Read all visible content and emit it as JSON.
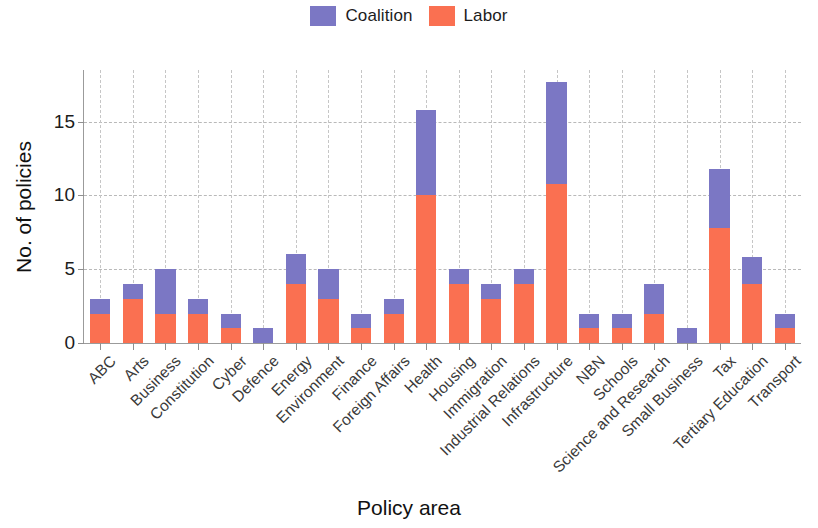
{
  "chart_data": {
    "type": "bar",
    "stacked": true,
    "title": "",
    "xlabel": "Policy area",
    "ylabel": "No. of policies",
    "ylim": [
      0,
      18.5
    ],
    "yticks": [
      0,
      5,
      10,
      15
    ],
    "ytick_labels": [
      "0",
      "5",
      "10",
      "15"
    ],
    "grid": "horizontal-and-vertical-dashed",
    "legend_position": "top-center",
    "categories": [
      "ABC",
      "Arts",
      "Business",
      "Constitution",
      "Cyber",
      "Defence",
      "Energy",
      "Environment",
      "Finance",
      "Foreign Affairs",
      "Health",
      "Housing",
      "Immigration",
      "Industrial Relations",
      "Infrastructure",
      "NBN",
      "Schools",
      "Science and Research",
      "Small Business",
      "Tax",
      "Tertiary Education",
      "Transport"
    ],
    "series": [
      {
        "name": "Labor",
        "color": "#FA7051",
        "values": [
          2,
          3,
          2,
          2,
          1,
          0,
          4,
          3,
          1,
          2,
          10,
          4,
          3,
          4,
          10.8,
          1,
          1,
          2,
          0,
          7.8,
          4,
          1
        ]
      },
      {
        "name": "Coalition",
        "color": "#7B77C4",
        "values": [
          1,
          1,
          3,
          1,
          1,
          1,
          2,
          2,
          1,
          1,
          5.8,
          1,
          1,
          1,
          6.9,
          1,
          1,
          2,
          1,
          4,
          1.8,
          1
        ]
      }
    ],
    "totals": [
      3,
      4,
      5,
      3,
      2,
      1,
      6,
      5,
      2,
      3,
      15.8,
      5,
      4,
      5,
      17.7,
      2,
      2,
      4,
      1,
      11.8,
      5.8,
      2
    ]
  },
  "legend": {
    "entries": [
      {
        "label": "Coalition",
        "color": "#7B77C4"
      },
      {
        "label": "Labor",
        "color": "#FA7051"
      }
    ]
  },
  "axes": {
    "y_title": "No. of policies",
    "x_title": "Policy area"
  }
}
